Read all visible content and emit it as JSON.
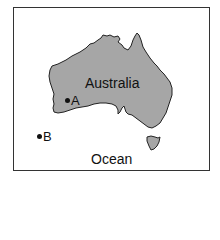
{
  "map": {
    "landmass_label": "Australia",
    "water_label": "Ocean",
    "points": [
      {
        "id": "A",
        "label": "A",
        "location": "on land, southwestern Australia"
      },
      {
        "id": "B",
        "label": "B",
        "location": "in ocean, west of Australia"
      }
    ],
    "colors": {
      "land": "#a6a6a6",
      "outline": "#222222",
      "water": "#ffffff",
      "frame": "#333333",
      "text": "#111111"
    }
  }
}
